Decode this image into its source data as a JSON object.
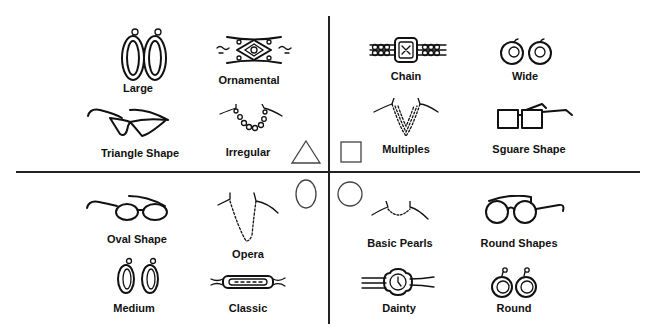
{
  "diagram": {
    "title": "",
    "quadrants": [
      {
        "position": "top-left",
        "face_shape": "triangle",
        "items": [
          {
            "label": "Large",
            "icon": "large-hoop-earrings-icon",
            "category": "earrings"
          },
          {
            "label": "Ornamental",
            "icon": "ornamental-bracelet-icon",
            "category": "watch"
          },
          {
            "label": "Triangle Shape",
            "icon": "cat-eye-glasses-icon",
            "category": "glasses"
          },
          {
            "label": "Irregular",
            "icon": "irregular-necklace-icon",
            "category": "necklace"
          }
        ]
      },
      {
        "position": "top-right",
        "face_shape": "square",
        "items": [
          {
            "label": "Chain",
            "icon": "chain-watch-icon",
            "category": "watch"
          },
          {
            "label": "Wide",
            "icon": "wide-earrings-icon",
            "category": "earrings"
          },
          {
            "label": "Multiples",
            "icon": "multiple-strand-necklace-icon",
            "category": "necklace"
          },
          {
            "label": "Sguare Shape",
            "icon": "square-glasses-icon",
            "category": "glasses"
          }
        ]
      },
      {
        "position": "bottom-left",
        "face_shape": "oval",
        "items": [
          {
            "label": "Oval Shape",
            "icon": "oval-glasses-icon",
            "category": "glasses"
          },
          {
            "label": "Opera",
            "icon": "opera-necklace-icon",
            "category": "necklace"
          },
          {
            "label": "Medium",
            "icon": "medium-hoop-earrings-icon",
            "category": "earrings"
          },
          {
            "label": "Classic",
            "icon": "classic-watch-icon",
            "category": "watch"
          }
        ]
      },
      {
        "position": "bottom-right",
        "face_shape": "round",
        "items": [
          {
            "label": "Basic Pearls",
            "icon": "pearl-necklace-icon",
            "category": "necklace"
          },
          {
            "label": "Round Shapes",
            "icon": "round-glasses-icon",
            "category": "glasses"
          },
          {
            "label": "Dainty",
            "icon": "dainty-watch-icon",
            "category": "watch"
          },
          {
            "label": "Round",
            "icon": "round-earrings-icon",
            "category": "earrings"
          }
        ]
      }
    ],
    "colors": {
      "ink": "#111111",
      "background": "#ffffff"
    }
  }
}
